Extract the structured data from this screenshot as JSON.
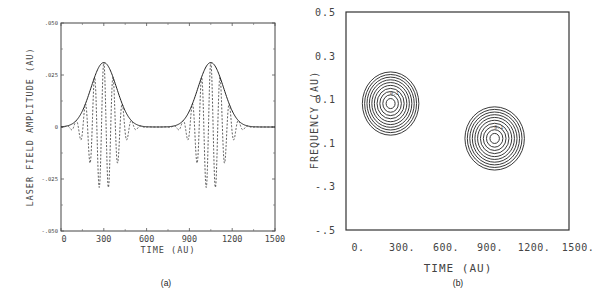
{
  "chart_data": [
    {
      "id": "a",
      "type": "line",
      "caption": "(a)",
      "title": "",
      "xlabel": "TIME (AU)",
      "ylabel": "LASER FIELD AMPLITUDE (AU)",
      "xlim": [
        0,
        1500
      ],
      "ylim": [
        -0.05,
        0.05
      ],
      "xticks": [
        "0",
        "300",
        "600",
        "900",
        "1200",
        "1500"
      ],
      "yticks": [
        ".050",
        ".025",
        "0",
        "-.025",
        "-.050"
      ],
      "ytick_values": [
        0.05,
        0.025,
        0,
        -0.025,
        -0.05
      ],
      "grid": false,
      "series": [
        {
          "name": "envelope",
          "style": "solid",
          "description": "two Gaussian pulses",
          "pulses": [
            {
              "center": 300,
              "peak": 0.031,
              "width_sigma": 90
            },
            {
              "center": 1050,
              "peak": 0.031,
              "width_sigma": 90
            }
          ]
        },
        {
          "name": "field",
          "style": "dashed",
          "description": "oscillating carrier under envelope",
          "carrier_period": 65,
          "min": -0.031
        }
      ]
    },
    {
      "id": "b",
      "type": "contour",
      "caption": "(b)",
      "title": "",
      "xlabel": "TIME (AU)",
      "ylabel": "FREQUENCY (AU)",
      "xlim": [
        0,
        1500
      ],
      "ylim": [
        -0.5,
        0.5
      ],
      "xticks": [
        "0.",
        "300.",
        "600.",
        "900.",
        "1200.",
        "1500."
      ],
      "yticks": [
        "0.5",
        "0.3",
        "0.1",
        "-.1",
        "-.3",
        "-.5"
      ],
      "ytick_values": [
        0.5,
        0.3,
        0.1,
        -0.1,
        -0.3,
        -0.5
      ],
      "grid": false,
      "blobs": [
        {
          "center_time": 300,
          "center_freq": 0.08,
          "radius_time": 190,
          "radius_freq": 0.1,
          "levels": 10,
          "label": "0.1"
        },
        {
          "center_time": 1000,
          "center_freq": -0.08,
          "radius_time": 200,
          "radius_freq": 0.1,
          "levels": 10,
          "label": "0.1"
        }
      ]
    }
  ]
}
